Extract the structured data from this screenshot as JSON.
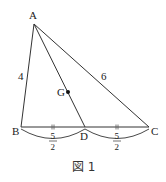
{
  "figure": {
    "caption": "図 1",
    "points": {
      "A": {
        "label": "A",
        "x": 34,
        "y": 24
      },
      "B": {
        "label": "B",
        "x": 21,
        "y": 127
      },
      "C": {
        "label": "C",
        "x": 149,
        "y": 127
      },
      "D": {
        "label": "D",
        "x": 85,
        "y": 127
      },
      "G": {
        "label": "G",
        "x": 68,
        "y": 92
      }
    },
    "lengths": {
      "AB": "4",
      "AC": "6",
      "BD": {
        "numerator": "5",
        "denominator": "2"
      },
      "DC": {
        "numerator": "5",
        "denominator": "2"
      }
    },
    "colors": {
      "line": "#333333",
      "text": "#222222"
    }
  }
}
